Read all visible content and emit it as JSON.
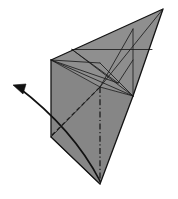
{
  "figure": {
    "kind": "line-drawing",
    "background_color": "#ffffff",
    "paper_fill_color": "#8f8f8f",
    "paper_fill_color_shaded": "#868686",
    "crease_line_color": "#1a1a1a",
    "outline_color": "#141414",
    "arrow_color": "#111111",
    "canvas": {
      "width": 178,
      "height": 199
    }
  },
  "shape": {
    "name": "folded-paper-body",
    "description": "Large gray kite-like folded paper form, apex at upper right, tip at bottom",
    "vertices": {
      "top_apex": {
        "label": "top-right apex",
        "x": 163,
        "y": 9
      },
      "left_top": {
        "label": "left upper vertex",
        "x": 51,
        "y": 60
      },
      "left_bottom": {
        "label": "left lower corner",
        "x": 51,
        "y": 137
      },
      "bottom_tip": {
        "label": "bottom tip",
        "x": 100,
        "y": 184
      },
      "right_mid": {
        "label": "right middle vertex",
        "x": 133,
        "y": 96
      },
      "center": {
        "label": "center crease intersection",
        "x": 100,
        "y": 87
      }
    },
    "outline_points": "163,9 51,60 51,137 100,184 133,96",
    "upper_panel_points": "163,9 51,60 100,87 133,96",
    "lower_left_panel_points": "51,60 51,137 100,184 100,87",
    "lower_right_panel_points": "100,87 100,184 133,96"
  },
  "creases": {
    "label": "crease lines",
    "valley_mountain_solid": [
      {
        "name": "crease-top-edge-to-center",
        "x1": 51,
        "y1": 60,
        "x2": 133,
        "y2": 96
      },
      {
        "name": "crease-left-to-right-mid",
        "x1": 51,
        "y1": 60,
        "x2": 163,
        "y2": 9
      },
      {
        "name": "crease-center-to-apex",
        "x1": 100,
        "y1": 87,
        "x2": 163,
        "y2": 9
      },
      {
        "name": "crease-horizontal-upper",
        "x1": 73,
        "y1": 49,
        "x2": 150,
        "y2": 49
      },
      {
        "name": "crease-vertical-right",
        "x1": 133,
        "y1": 30,
        "x2": 133,
        "y2": 96
      },
      {
        "name": "crease-diag-a",
        "x1": 73,
        "y1": 49,
        "x2": 133,
        "y2": 96
      },
      {
        "name": "crease-diag-b",
        "x1": 133,
        "y1": 30,
        "x2": 100,
        "y2": 87
      },
      {
        "name": "crease-diag-c",
        "x1": 73,
        "y1": 49,
        "x2": 116,
        "y2": 84
      },
      {
        "name": "crease-left-fan-1",
        "x1": 51,
        "y1": 60,
        "x2": 100,
        "y2": 87
      },
      {
        "name": "crease-left-fan-2",
        "x1": 51,
        "y1": 60,
        "x2": 116,
        "y2": 84
      },
      {
        "name": "crease-lower-left-diag",
        "x1": 51,
        "y1": 137,
        "x2": 100,
        "y2": 87
      },
      {
        "name": "crease-lower-left-edge",
        "x1": 51,
        "y1": 137,
        "x2": 100,
        "y2": 184
      },
      {
        "name": "crease-bottom-right",
        "x1": 100,
        "y1": 184,
        "x2": 133,
        "y2": 96
      },
      {
        "name": "crease-center-down",
        "x1": 100,
        "y1": 87,
        "x2": 133,
        "y2": 96
      }
    ],
    "hidden_dashed": [
      {
        "name": "hidden-crease-left-bottom-to-center",
        "x1": 51,
        "y1": 137,
        "x2": 100,
        "y2": 87
      },
      {
        "name": "hidden-crease-short",
        "x1": 57,
        "y1": 123,
        "x2": 92,
        "y2": 95
      }
    ],
    "axis_dash_dot": [
      {
        "name": "fold-axis-vertical",
        "x1": 100,
        "y1": 87,
        "x2": 100,
        "y2": 184
      }
    ]
  },
  "arrow": {
    "name": "fold-direction-arrow",
    "description": "Curved arrow sweeping from the bottom tip leftward and upward",
    "path": "M 100,181 C 84,150 56,116 18,87",
    "head": {
      "tip_x": 13,
      "tip_y": 85,
      "direction": "left-up"
    },
    "color": "#111111",
    "stroke_width": 1.6
  },
  "labels": {
    "caption": "",
    "annotations": []
  }
}
